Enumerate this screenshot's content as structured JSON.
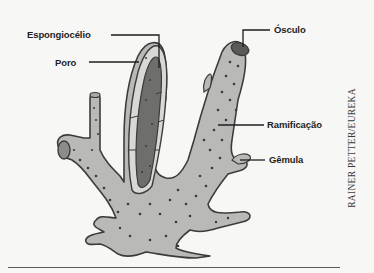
{
  "figure": {
    "labels": {
      "espongiocelio": "Espongiocélio",
      "poro": "Poro",
      "osculo": "Ósculo",
      "ramificacao": "Ramificação",
      "gemula": "Gêmula"
    },
    "credit": "RAINER PETTER/EUREKA",
    "colors": {
      "body_fill": "#b9b9b7",
      "cavity_fill": "#6e6e6c",
      "outline": "#3c3c3c",
      "pore_dot": "#3a3a3a",
      "label_text": "#1e1e1e"
    }
  }
}
